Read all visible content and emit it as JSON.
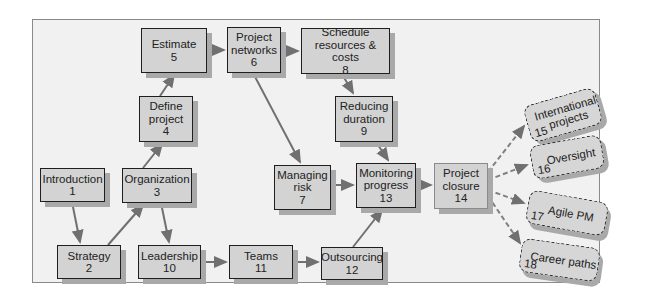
{
  "nodes": {
    "introduction": {
      "label": "Introduction",
      "num": "1"
    },
    "strategy": {
      "label": "Strategy",
      "num": "2"
    },
    "organization": {
      "label": "Organization",
      "num": "3"
    },
    "define_project": {
      "label1": "Define",
      "label2": "project",
      "num": "4"
    },
    "estimate": {
      "label": "Estimate",
      "num": "5"
    },
    "project_networks": {
      "label1": "Project",
      "label2": "networks",
      "num": "6"
    },
    "managing_risk": {
      "label1": "Managing",
      "label2": "risk",
      "num": "7"
    },
    "schedule": {
      "label1": "Schedule",
      "label2": "resources & costs",
      "num": "8"
    },
    "reducing_duration": {
      "label1": "Reducing",
      "label2": "duration",
      "num": "9"
    },
    "leadership": {
      "label": "Leadership",
      "num": "10"
    },
    "teams": {
      "label": "Teams",
      "num": "11"
    },
    "outsourcing": {
      "label": "Outsourcing",
      "num": "12"
    },
    "monitoring_progress": {
      "label1": "Monitoring",
      "label2": "progress",
      "num": "13"
    },
    "project_closure": {
      "label1": "Project",
      "label2": "closure",
      "num": "14"
    },
    "international": {
      "label1": "International",
      "label2": "projects",
      "num": "15"
    },
    "oversight": {
      "label": "Oversight",
      "num": "16"
    },
    "agile_pm": {
      "label": "Agile PM",
      "num": "17"
    },
    "career_paths": {
      "label": "Career paths",
      "num": "18"
    }
  },
  "edges": [
    [
      "1",
      "2"
    ],
    [
      "2",
      "3"
    ],
    [
      "3",
      "4"
    ],
    [
      "4",
      "5"
    ],
    [
      "5",
      "6"
    ],
    [
      "6",
      "8"
    ],
    [
      "8",
      "9"
    ],
    [
      "6",
      "7"
    ],
    [
      "3",
      "10"
    ],
    [
      "10",
      "11"
    ],
    [
      "11",
      "12"
    ],
    [
      "7",
      "13"
    ],
    [
      "9",
      "13"
    ],
    [
      "12",
      "13"
    ],
    [
      "13",
      "14"
    ],
    [
      "14",
      "15"
    ],
    [
      "14",
      "16"
    ],
    [
      "14",
      "17"
    ],
    [
      "14",
      "18"
    ]
  ],
  "colors": {
    "box_fill": "#d3d3d3",
    "box_border": "#1e1e1e",
    "arrow": "#707070",
    "frame_bg": "#f1f1f1"
  }
}
